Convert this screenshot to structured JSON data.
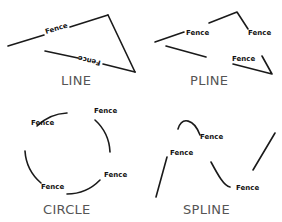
{
  "linetype_name": "Fence",
  "panels": [
    {
      "id": "line",
      "caption": "LINE"
    },
    {
      "id": "pline",
      "caption": "PLINE"
    },
    {
      "id": "circle",
      "caption": "CIRCLE"
    },
    {
      "id": "spline",
      "caption": "SPLINE"
    }
  ],
  "labels": {
    "line_1": "Fence",
    "line_2": "Fence",
    "pline_1": "Fence",
    "pline_2": "Fence",
    "pline_3": "Fence",
    "circle_1": "Fence",
    "circle_2": "Fence",
    "circle_3": "Fence",
    "circle_4": "Fence",
    "spline_1": "Fence",
    "spline_2": "Fence",
    "spline_3": "Fence"
  },
  "colors": {
    "stroke": "#1a1a1a",
    "caption": "#555555",
    "background": "#ffffff"
  }
}
